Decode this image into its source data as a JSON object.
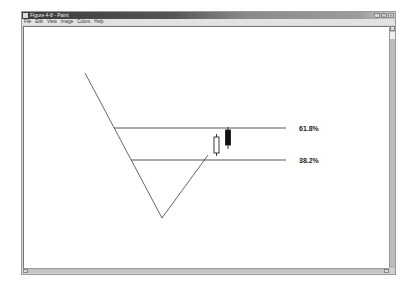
{
  "window": {
    "title": "Figure 4-8 - Paint",
    "controls": {
      "minimize": "_",
      "maximize": "□",
      "close": "×"
    }
  },
  "menu": {
    "items": [
      {
        "label": "File"
      },
      {
        "label": "Edit"
      },
      {
        "label": "View"
      },
      {
        "label": "Image"
      },
      {
        "label": "Colors"
      },
      {
        "label": "Help"
      }
    ]
  },
  "drawing": {
    "fib_levels": [
      {
        "label": "61.8%",
        "y": 128,
        "x_start": 114,
        "x_end": 286
      },
      {
        "label": "38.2%",
        "y": 160,
        "x_start": 131,
        "x_end": 286
      }
    ],
    "price_path": {
      "down_leg": {
        "from": [
          85,
          73
        ],
        "to": [
          162,
          218
        ]
      },
      "up_leg": {
        "from": [
          162,
          218
        ],
        "to": [
          208,
          155
        ]
      }
    },
    "candles": [
      {
        "type": "bullish",
        "fill": "#ffffff",
        "x": 216.5,
        "body_top": 137,
        "body_bottom": 153,
        "wick_top": 134,
        "wick_bottom": 156
      },
      {
        "type": "bearish",
        "fill": "#111111",
        "x": 228,
        "body_top": 130,
        "body_bottom": 145,
        "wick_top": 127,
        "wick_bottom": 149
      }
    ],
    "colors": {
      "line": "#555555",
      "level": "#444444"
    }
  }
}
